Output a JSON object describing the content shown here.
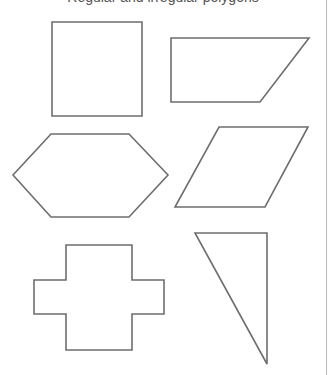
{
  "header": {
    "text": "Regular and irregular polygons"
  },
  "style": {
    "stroke_color": "#6e6e6e",
    "border_color": "#b8b8b8",
    "background": "#ffffff"
  },
  "shapes": [
    {
      "name": "square",
      "points": "52,22 142,22 142,116 52,116"
    },
    {
      "name": "trapezoid",
      "points": "171,38 309,38 260,102 171,102"
    },
    {
      "name": "hexagon",
      "points": "51,134 129,134 168,175 129,217 51,217 13,175"
    },
    {
      "name": "rhombus",
      "points": "219,127 308,127 265,207 175,207"
    },
    {
      "name": "cross",
      "points": "66,245 132,245 132,280 164,280 164,314 132,314 132,350 66,350 66,314 34,314 34,280 66,280"
    },
    {
      "name": "right-triangle",
      "points": "195,233 267,233 267,364"
    }
  ]
}
